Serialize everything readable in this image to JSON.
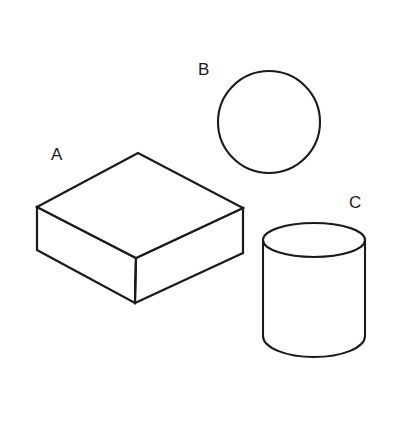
{
  "figure": {
    "background_color": "#ffffff",
    "stroke_color": "#1a1a1a",
    "fill_color": "#ffffff",
    "width": 397,
    "height": 436,
    "shapes": [
      {
        "id": "a",
        "label": "A",
        "kind": "rectangular-box",
        "description": "Isometric rectangular box / slab drawn in outline"
      },
      {
        "id": "b",
        "label": "B",
        "kind": "circle",
        "description": "Plain circle outline"
      },
      {
        "id": "c",
        "label": "C",
        "kind": "cylinder",
        "description": "Upright cylinder with visible top ellipse"
      }
    ]
  }
}
